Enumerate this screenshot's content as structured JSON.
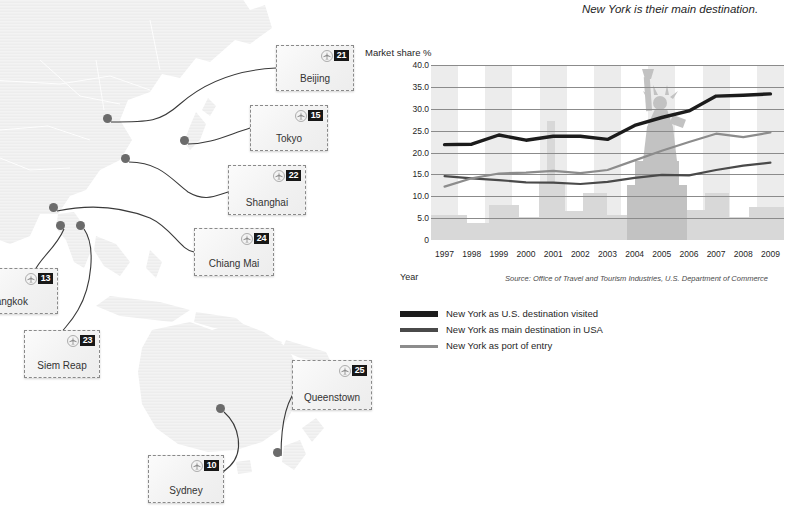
{
  "headline": "New York is their main destination.",
  "chart_panel": {
    "y_axis_title": "Market share %",
    "x_axis_title": "Year",
    "source": "Source: Office of Travel and Tourism Industries, U.S. Department of Commerce"
  },
  "chart_data": {
    "type": "line",
    "title": "New York is their main destination.",
    "xlabel": "Year",
    "ylabel": "Market share %",
    "x": [
      1997,
      1998,
      1999,
      2000,
      2001,
      2002,
      2003,
      2004,
      2005,
      2006,
      2007,
      2008,
      2009
    ],
    "ylim": [
      0,
      40
    ],
    "yticks": [
      "0",
      "5.0",
      "10.0",
      "15.0",
      "20.0",
      "25.0",
      "30.0",
      "35.0",
      "40.0"
    ],
    "ytick_values": [
      0,
      5,
      10,
      15,
      20,
      25,
      30,
      35,
      40
    ],
    "grid": true,
    "legend_position": "below",
    "series": [
      {
        "name": "New York as U.S. destination visited",
        "color": "#1c1c1c",
        "width": 3.4,
        "values": [
          21.8,
          21.9,
          24.0,
          22.8,
          23.7,
          23.7,
          23.0,
          26.2,
          28.0,
          29.5,
          32.9,
          33.1,
          33.4
        ]
      },
      {
        "name": "New York as main destination in USA",
        "color": "#4a4a4a",
        "width": 2.2,
        "values": [
          14.6,
          14.1,
          13.7,
          13.2,
          13.1,
          12.8,
          13.3,
          14.2,
          14.9,
          14.8,
          16.0,
          17.0,
          17.7
        ]
      },
      {
        "name": "New York as port of entry",
        "color": "#8c8c8c",
        "width": 2.2,
        "values": [
          12.2,
          14.1,
          15.2,
          15.4,
          15.8,
          15.3,
          16.0,
          18.2,
          20.4,
          22.4,
          24.3,
          23.5,
          24.6
        ]
      }
    ]
  },
  "legend": [
    {
      "label": "New York as U.S. destination visited",
      "color": "#1c1c1c",
      "thickness": 6
    },
    {
      "label": "New York as main destination in USA",
      "color": "#4a4a4a",
      "thickness": 4
    },
    {
      "label": "New York as port of entry",
      "color": "#8c8c8c",
      "thickness": 3
    }
  ],
  "map": {
    "stamps": [
      {
        "city": "Beijing",
        "number": "21",
        "x": 276,
        "y": 45,
        "w": 78,
        "h": 46,
        "clip": false
      },
      {
        "city": "Tokyo",
        "number": "15",
        "x": 250,
        "y": 105,
        "w": 78,
        "h": 46,
        "clip": false
      },
      {
        "city": "Shanghai",
        "number": "22",
        "x": 228,
        "y": 165,
        "w": 78,
        "h": 50,
        "clip": false
      },
      {
        "city": "Chiang Mai",
        "number": "24",
        "x": 194,
        "y": 228,
        "w": 80,
        "h": 48,
        "clip": false
      },
      {
        "city": "Bangkok",
        "number": "13",
        "x": -16,
        "y": 268,
        "w": 74,
        "h": 46,
        "clip": true
      },
      {
        "city": "Siem Reap",
        "number": "23",
        "x": 24,
        "y": 330,
        "w": 76,
        "h": 48,
        "clip": false
      },
      {
        "city": "Queenstown",
        "number": "25",
        "x": 292,
        "y": 360,
        "w": 80,
        "h": 50,
        "clip": false
      },
      {
        "city": "Sydney",
        "number": "10",
        "x": 148,
        "y": 455,
        "w": 76,
        "h": 48,
        "clip": false
      }
    ],
    "dots": [
      {
        "name": "dot-beijing",
        "x": 107,
        "y": 118
      },
      {
        "name": "dot-tokyo",
        "x": 184,
        "y": 140
      },
      {
        "name": "dot-shanghai",
        "x": 125,
        "y": 158
      },
      {
        "name": "dot-chiangmai",
        "x": 53,
        "y": 207
      },
      {
        "name": "dot-bangkok",
        "x": 60,
        "y": 225
      },
      {
        "name": "dot-siemreap",
        "x": 80,
        "y": 225
      },
      {
        "name": "dot-sydney",
        "x": 220,
        "y": 408
      },
      {
        "name": "dot-queenstown",
        "x": 277,
        "y": 452
      }
    ]
  }
}
